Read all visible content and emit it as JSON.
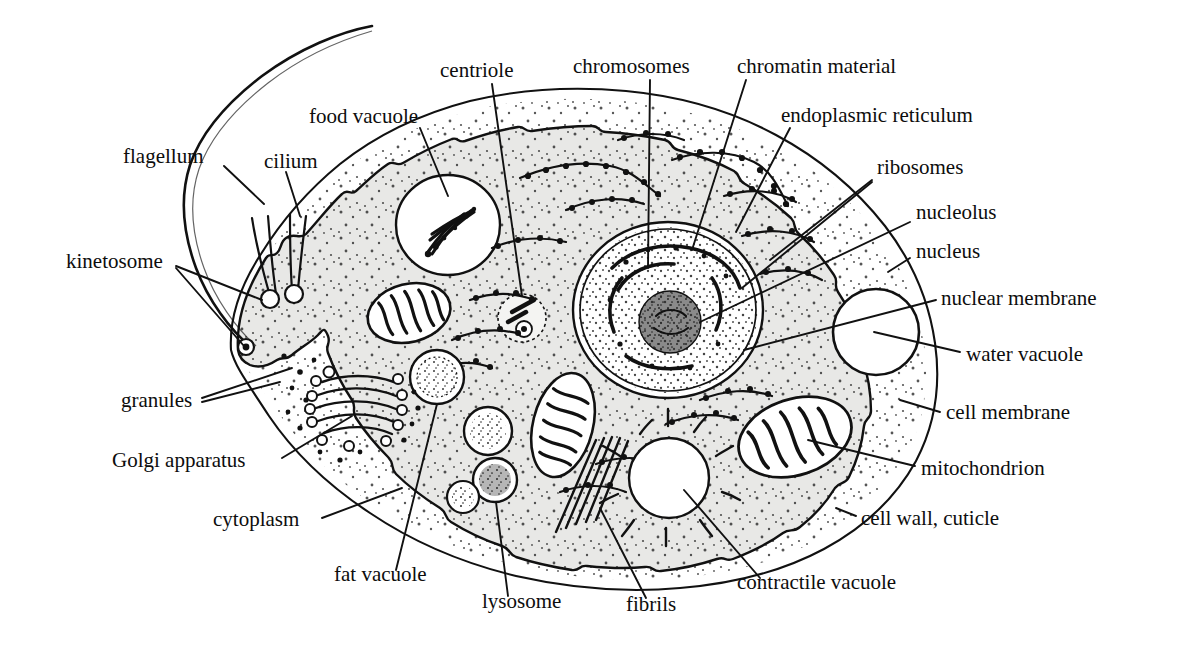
{
  "figure": {
    "kind": "biology-diagram",
    "background_color": "#ffffff",
    "ink_color": "#0d0d0d",
    "cytoplasm_color": "#e8e8e6",
    "vacuole_color": "#ffffff"
  },
  "labels": [
    {
      "id": "flagellum",
      "text": "flagellum",
      "x": 123,
      "y": 160,
      "anchor": "start"
    },
    {
      "id": "cilium",
      "text": "cilium",
      "x": 264,
      "y": 165,
      "anchor": "start"
    },
    {
      "id": "food-vacuole",
      "text": "food vacuole",
      "x": 309,
      "y": 120,
      "anchor": "start"
    },
    {
      "id": "centriole",
      "text": "centriole",
      "x": 440,
      "y": 74,
      "anchor": "start"
    },
    {
      "id": "chromosomes",
      "text": "chromosomes",
      "x": 573,
      "y": 70,
      "anchor": "start"
    },
    {
      "id": "chromatin-material",
      "text": "chromatin material",
      "x": 737,
      "y": 70,
      "anchor": "start"
    },
    {
      "id": "endoplasmic-reticulum",
      "text": "endoplasmic reticulum",
      "x": 781,
      "y": 119,
      "anchor": "start"
    },
    {
      "id": "ribosomes",
      "text": "ribosomes",
      "x": 877,
      "y": 171,
      "anchor": "start"
    },
    {
      "id": "nucleolus",
      "text": "nucleolus",
      "x": 916,
      "y": 216,
      "anchor": "start"
    },
    {
      "id": "nucleus",
      "text": "nucleus",
      "x": 916,
      "y": 255,
      "anchor": "start"
    },
    {
      "id": "nuclear-membrane",
      "text": "nuclear membrane",
      "x": 941,
      "y": 302,
      "anchor": "start"
    },
    {
      "id": "water-vacuole",
      "text": "water vacuole",
      "x": 966,
      "y": 358,
      "anchor": "start"
    },
    {
      "id": "cell-membrane",
      "text": "cell membrane",
      "x": 946,
      "y": 416,
      "anchor": "start"
    },
    {
      "id": "mitochondrion",
      "text": "mitochondrion",
      "x": 921,
      "y": 472,
      "anchor": "start"
    },
    {
      "id": "cell-wall-cuticle",
      "text": "cell wall, cuticle",
      "x": 861,
      "y": 522,
      "anchor": "start"
    },
    {
      "id": "kinetosome",
      "text": "kinetosome",
      "x": 66,
      "y": 265,
      "anchor": "start"
    },
    {
      "id": "granules",
      "text": "granules",
      "x": 121,
      "y": 404,
      "anchor": "start"
    },
    {
      "id": "golgi-apparatus",
      "text": "Golgi apparatus",
      "x": 112,
      "y": 464,
      "anchor": "start"
    },
    {
      "id": "cytoplasm",
      "text": "cytoplasm",
      "x": 213,
      "y": 523,
      "anchor": "start"
    },
    {
      "id": "fat-vacuole",
      "text": "fat vacuole",
      "x": 334,
      "y": 578,
      "anchor": "start"
    },
    {
      "id": "lysosome",
      "text": "lysosome",
      "x": 482,
      "y": 605,
      "anchor": "start"
    },
    {
      "id": "fibrils",
      "text": "fibrils",
      "x": 626,
      "y": 608,
      "anchor": "start"
    },
    {
      "id": "contractile-vacuole",
      "text": "contractile vacuole",
      "x": 737,
      "y": 586,
      "anchor": "start"
    }
  ]
}
